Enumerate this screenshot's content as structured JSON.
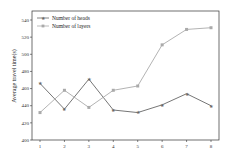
{
  "chart_data": {
    "type": "line",
    "title": "",
    "xlabel": "",
    "ylabel": "Average travel time(s)",
    "x": [
      1,
      2,
      3,
      4,
      5,
      6,
      7,
      8
    ],
    "ylim": [
      400,
      550
    ],
    "yticks": [
      400,
      420,
      440,
      460,
      480,
      500,
      520,
      540
    ],
    "grid": false,
    "legend_position": "upper left",
    "series": [
      {
        "name": "Number of heads",
        "color": "#666666",
        "marker": "star",
        "values": [
          466,
          436,
          471,
          435,
          432,
          441,
          454,
          440
        ]
      },
      {
        "name": "Number of layers",
        "color": "#aaaaaa",
        "marker": "square",
        "values": [
          432,
          458,
          438,
          458,
          463,
          511,
          529,
          531
        ]
      }
    ]
  }
}
